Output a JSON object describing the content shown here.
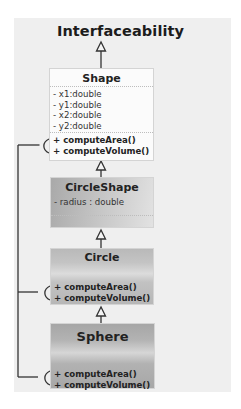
{
  "diagram": {
    "title": "Interfaceability",
    "classes": {
      "shape": {
        "name": "Shape",
        "attributes": [
          "- x1:double",
          "- y1:double",
          "- x2:double",
          "- y2:double"
        ],
        "methods": [
          "+ computeArea()",
          "+ computeVolume()"
        ]
      },
      "circleshape": {
        "name": "CircleShape",
        "attributes": [
          "- radius : double"
        ],
        "methods": []
      },
      "circle": {
        "name": "Circle",
        "attributes": [],
        "methods": [
          "+ computeArea()",
          "+ computeVolume()"
        ]
      },
      "sphere": {
        "name": "Sphere",
        "attributes": [],
        "methods": [
          "+ computeArea()",
          "+ computeVolume()"
        ]
      }
    },
    "relations": [
      {
        "type": "generalization",
        "from": "Shape",
        "to": "Interfaceability"
      },
      {
        "type": "generalization",
        "from": "CircleShape",
        "to": "Shape"
      },
      {
        "type": "generalization",
        "from": "Circle",
        "to": "CircleShape"
      },
      {
        "type": "generalization",
        "from": "Sphere",
        "to": "Circle"
      },
      {
        "type": "required-interface",
        "from": "Shape",
        "note": "socket connectors on method compartments, joined by a left vertical line"
      },
      {
        "type": "required-interface",
        "from": "Circle"
      },
      {
        "type": "required-interface",
        "from": "Sphere"
      }
    ],
    "colors": {
      "panel": "#efefef",
      "shape_fill": "#fbfbfb",
      "gray_fill": "#b5b5b5",
      "line": "#333333"
    }
  }
}
